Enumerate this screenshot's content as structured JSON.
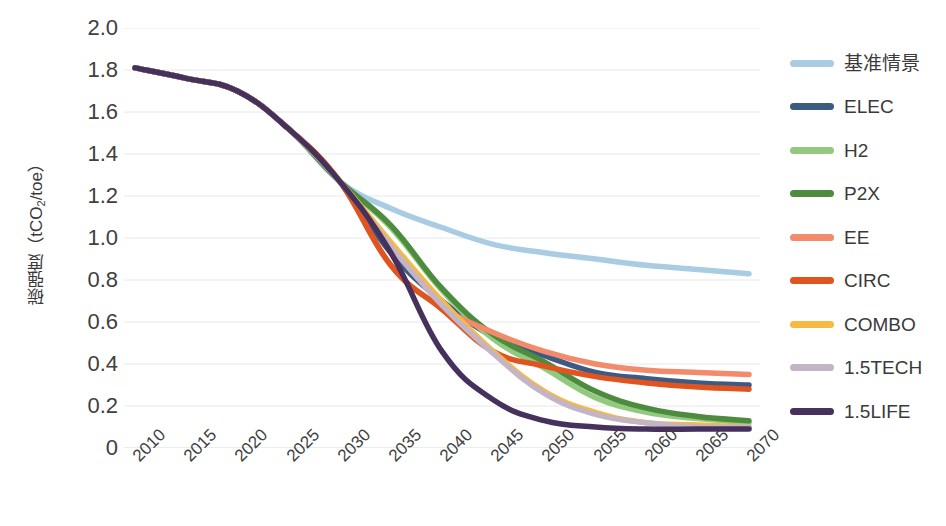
{
  "chart_data": {
    "type": "line",
    "title": "",
    "xlabel": "",
    "ylabel": "碳强度（tCO₂/toe）",
    "x": [
      2010,
      2015,
      2020,
      2025,
      2030,
      2035,
      2040,
      2045,
      2050,
      2055,
      2060,
      2065,
      2070
    ],
    "xlim": [
      2010,
      2070
    ],
    "ylim": [
      0,
      2.0
    ],
    "y_ticks": [
      "2.0",
      "1.8",
      "1.6",
      "1.4",
      "1.2",
      "1.0",
      "0.8",
      "0.6",
      "0.4",
      "0.2",
      "0"
    ],
    "y_tick_values": [
      2.0,
      1.8,
      1.6,
      1.4,
      1.2,
      1.0,
      0.8,
      0.6,
      0.4,
      0.2,
      0
    ],
    "x_tick_labels": [
      "2010",
      "2015",
      "2020",
      "2025",
      "2030",
      "2035",
      "2040",
      "2045",
      "2050",
      "2055",
      "2060",
      "2065",
      "2070"
    ],
    "grid": "horizontal",
    "legend_position": "right",
    "series": [
      {
        "name": "基准情景",
        "color": "#a9cce3",
        "values": [
          1.81,
          1.76,
          1.7,
          1.52,
          1.27,
          1.14,
          1.05,
          0.97,
          0.93,
          0.9,
          0.87,
          0.85,
          0.83
        ]
      },
      {
        "name": "ELEC",
        "color": "#3c5a82",
        "values": [
          1.81,
          1.76,
          1.7,
          1.52,
          1.27,
          0.93,
          0.7,
          0.53,
          0.44,
          0.36,
          0.33,
          0.31,
          0.3
        ]
      },
      {
        "name": "H2",
        "color": "#93c97e",
        "values": [
          1.81,
          1.76,
          1.7,
          1.52,
          1.27,
          1.05,
          0.75,
          0.52,
          0.38,
          0.24,
          0.17,
          0.14,
          0.12
        ]
      },
      {
        "name": "P2X",
        "color": "#4d8b3f",
        "values": [
          1.81,
          1.76,
          1.7,
          1.52,
          1.27,
          1.06,
          0.76,
          0.54,
          0.41,
          0.27,
          0.19,
          0.15,
          0.13
        ]
      },
      {
        "name": "EE",
        "color": "#f18b6b",
        "values": [
          1.81,
          1.76,
          1.7,
          1.52,
          1.27,
          0.87,
          0.67,
          0.55,
          0.46,
          0.4,
          0.37,
          0.36,
          0.35
        ]
      },
      {
        "name": "CIRC",
        "color": "#e0551f",
        "values": [
          1.81,
          1.76,
          1.7,
          1.52,
          1.27,
          0.87,
          0.66,
          0.46,
          0.39,
          0.34,
          0.31,
          0.29,
          0.28
        ]
      },
      {
        "name": "COMBO",
        "color": "#f6b942",
        "values": [
          1.81,
          1.76,
          1.7,
          1.52,
          1.27,
          0.98,
          0.7,
          0.46,
          0.27,
          0.17,
          0.12,
          0.11,
          0.1
        ]
      },
      {
        "name": "1.5TECH",
        "color": "#c3b4c6",
        "values": [
          1.81,
          1.76,
          1.7,
          1.52,
          1.27,
          0.96,
          0.68,
          0.45,
          0.26,
          0.16,
          0.12,
          0.1,
          0.1
        ]
      },
      {
        "name": "1.5LIFE",
        "color": "#46315c",
        "values": [
          1.81,
          1.76,
          1.7,
          1.52,
          1.27,
          0.93,
          0.46,
          0.23,
          0.13,
          0.1,
          0.09,
          0.09,
          0.09
        ]
      }
    ]
  },
  "legend": {
    "items": [
      {
        "label": "基准情景"
      },
      {
        "label": "ELEC"
      },
      {
        "label": "H2"
      },
      {
        "label": "P2X"
      },
      {
        "label": "EE"
      },
      {
        "label": "CIRC"
      },
      {
        "label": "COMBO"
      },
      {
        "label": "1.5TECH"
      },
      {
        "label": "1.5LIFE"
      }
    ]
  }
}
